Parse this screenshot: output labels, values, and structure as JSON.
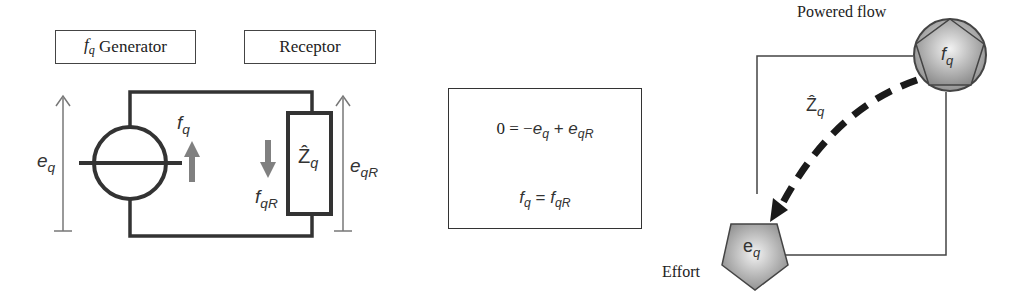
{
  "circuit": {
    "generator_box": {
      "symbol": "f",
      "sub": "q",
      "label": "Generator"
    },
    "receptor_box": {
      "label": "Receptor"
    },
    "effort_left": {
      "symbol": "e",
      "sub": "q"
    },
    "flow_generator": {
      "symbol": "f",
      "sub": "q"
    },
    "flow_receptor": {
      "symbol": "f",
      "sub": "qR"
    },
    "impedance": {
      "symbol": "Ẑ",
      "sub": "q"
    },
    "effort_right": {
      "symbol": "e",
      "sub": "qR"
    }
  },
  "equations": {
    "line1": {
      "lhs": "0 = −",
      "t1": "e",
      "t1_sub": "q",
      "op": " + ",
      "t2": "e",
      "t2_sub": "qR"
    },
    "line2": {
      "t1": "f",
      "t1_sub": "q",
      "op": " = ",
      "t2": "f",
      "t2_sub": "qR"
    }
  },
  "graph": {
    "top_label": "Powered flow",
    "top_node": {
      "symbol": "f",
      "sub": "q"
    },
    "bottom_label": "Effort",
    "bottom_node": {
      "symbol": "e",
      "sub": "q"
    },
    "edge_label": {
      "symbol": "Ẑ",
      "sub": "q"
    }
  },
  "colors": {
    "wire": "#333333",
    "arrow_gray": "#808080",
    "node_fill": "#b8b8b8",
    "dashed": "#1a1a1a"
  }
}
